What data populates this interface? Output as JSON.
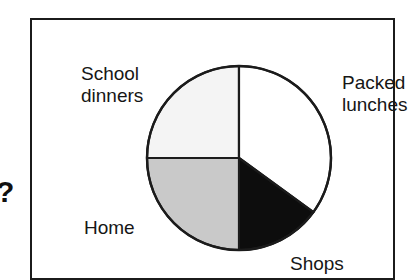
{
  "figure": {
    "marker": "?",
    "border_color": "#1b1b1b"
  },
  "chart_data": {
    "type": "pie",
    "title": "",
    "subtitle": "",
    "xlabel": "",
    "ylabel": "",
    "legend_position": "none",
    "grid": false,
    "labels_placement": "around-pie",
    "start_angle_deg": 0,
    "direction": "clockwise",
    "categories": [
      "Packed lunches",
      "Shops",
      "Home",
      "School dinners"
    ],
    "values": [
      35,
      15,
      25,
      25
    ],
    "units": "percent",
    "slices": [
      {
        "label": "Packed lunches",
        "value": 35,
        "start_angle_deg": 0,
        "end_angle_deg": 126,
        "fill": "#ffffff",
        "stroke": "#1b1b1b"
      },
      {
        "label": "Shops",
        "value": 15,
        "start_angle_deg": 126,
        "end_angle_deg": 180,
        "fill": "#0d0d0d",
        "stroke": "#1b1b1b"
      },
      {
        "label": "Home",
        "value": 25,
        "start_angle_deg": 180,
        "end_angle_deg": 270,
        "fill": "#c9c9c9",
        "stroke": "#1b1b1b"
      },
      {
        "label": "School dinners",
        "value": 25,
        "start_angle_deg": 270,
        "end_angle_deg": 360,
        "fill": "#f4f4f4",
        "stroke": "#1b1b1b"
      }
    ]
  },
  "labels": {
    "school_dinners": "School\ndinners",
    "packed_lunches": "Packed\nlunches",
    "home": "Home",
    "shops": "Shops"
  }
}
